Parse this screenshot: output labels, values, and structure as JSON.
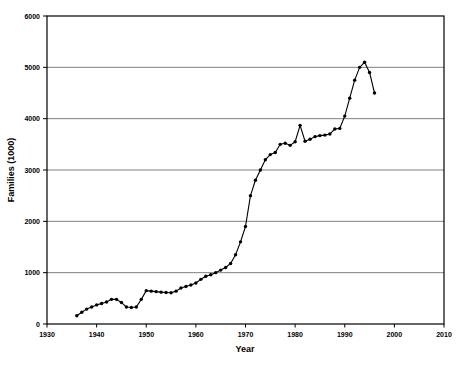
{
  "chart_data": {
    "type": "line",
    "title": "",
    "subtitle": "",
    "xlabel": "Year",
    "ylabel": "Families (1000)",
    "xlim": [
      1930,
      2010
    ],
    "ylim": [
      0,
      6000
    ],
    "xticks": [
      1930,
      1940,
      1950,
      1960,
      1970,
      1980,
      1990,
      2000,
      2010
    ],
    "xtick_labels": [
      "1930",
      "1940",
      "1950",
      "1960",
      "1970",
      "1980",
      "1990",
      "2000",
      "2010"
    ],
    "yticks": [
      0,
      1000,
      2000,
      3000,
      4000,
      5000,
      6000
    ],
    "ytick_labels": [
      "0",
      "1000",
      "2000",
      "3000",
      "4000",
      "5000",
      "6000"
    ],
    "grid": "horizontal",
    "legend": "none",
    "marker": "filled-circle",
    "line_color": "#000000",
    "marker_color": "#000000",
    "grid_color": "#808080",
    "axis_color": "#000000",
    "background": "#ffffff",
    "x": [
      1936,
      1937,
      1938,
      1939,
      1940,
      1941,
      1942,
      1943,
      1944,
      1945,
      1946,
      1947,
      1948,
      1949,
      1950,
      1951,
      1952,
      1953,
      1954,
      1955,
      1956,
      1957,
      1958,
      1959,
      1960,
      1961,
      1962,
      1963,
      1964,
      1965,
      1966,
      1967,
      1968,
      1969,
      1970,
      1971,
      1972,
      1973,
      1974,
      1975,
      1976,
      1977,
      1978,
      1979,
      1980,
      1981,
      1982,
      1983,
      1984,
      1985,
      1986,
      1987,
      1988,
      1989,
      1990,
      1991,
      1992,
      1993,
      1994,
      1995,
      1996
    ],
    "y": [
      162,
      230,
      290,
      330,
      372,
      400,
      430,
      480,
      480,
      420,
      330,
      320,
      330,
      480,
      650,
      640,
      630,
      620,
      615,
      610,
      640,
      700,
      730,
      760,
      800,
      870,
      930,
      960,
      1000,
      1050,
      1100,
      1180,
      1350,
      1600,
      1900,
      2500,
      2800,
      3000,
      3200,
      3300,
      3340,
      3500,
      3520,
      3480,
      3550,
      3870,
      3560,
      3600,
      3650,
      3670,
      3680,
      3700,
      3800,
      3810,
      4050,
      4400,
      4750,
      5000,
      5100,
      4900,
      4500
    ],
    "series": [
      {
        "name": "Families",
        "values": [
          162,
          230,
          290,
          330,
          372,
          400,
          430,
          480,
          480,
          420,
          330,
          320,
          330,
          480,
          650,
          640,
          630,
          620,
          615,
          610,
          640,
          700,
          730,
          760,
          800,
          870,
          930,
          960,
          1000,
          1050,
          1100,
          1180,
          1350,
          1600,
          1900,
          2500,
          2800,
          3000,
          3200,
          3300,
          3340,
          3500,
          3520,
          3480,
          3550,
          3870,
          3560,
          3600,
          3650,
          3670,
          3680,
          3700,
          3800,
          3810,
          4050,
          4400,
          4750,
          5000,
          5100,
          4900,
          4500
        ]
      }
    ]
  }
}
